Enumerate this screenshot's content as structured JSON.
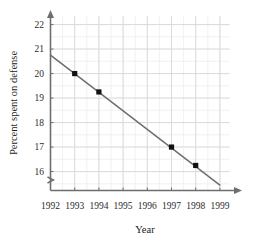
{
  "chart_data": {
    "type": "scatter",
    "title": "",
    "subtitle": "",
    "xlabel": "Year",
    "ylabel": "Percent spent on defense",
    "x": [
      1993,
      1994,
      1997,
      1998
    ],
    "values": [
      20.0,
      19.25,
      17.0,
      16.25
    ],
    "points": [
      {
        "x": 1993,
        "y": 20.0
      },
      {
        "x": 1994,
        "y": 19.25
      },
      {
        "x": 1997,
        "y": 17.0
      },
      {
        "x": 1998,
        "y": 16.25
      }
    ],
    "series": [
      {
        "name": "Percent spent on defense",
        "x": [
          1993,
          1994,
          1997,
          1998
        ],
        "values": [
          20.0,
          19.25,
          17.0,
          16.25
        ],
        "marker": "square",
        "marker_color": "#111111"
      },
      {
        "name": "trend line",
        "type": "line",
        "x": [
          1992,
          1999
        ],
        "values": [
          20.75,
          15.45
        ],
        "line_color": "#6e6e6e"
      }
    ],
    "xticks": [
      1992,
      1993,
      1994,
      1995,
      1996,
      1997,
      1998,
      1999
    ],
    "xtick_labels": [
      "1992",
      "1993",
      "1994",
      "1995",
      "1996",
      "1997",
      "1998",
      "1999"
    ],
    "yticks": [
      16,
      17,
      18,
      19,
      20,
      21,
      22
    ],
    "ytick_labels": [
      "16",
      "17",
      "18",
      "19",
      "20",
      "21",
      "22"
    ],
    "xlim": [
      1992,
      1999.4
    ],
    "ylim": [
      15.35,
      22.35
    ],
    "y_axis_break": true,
    "grid": true,
    "minor_grid": true,
    "minor_grid_step_x": 0.5,
    "minor_grid_step_y": 0.5,
    "legend": "none",
    "axis_arrows": true,
    "colors": {
      "major_grid": "#d9d9d9",
      "minor_grid": "#ededed",
      "axis": "#6e6e6e",
      "trend_line": "#6e6e6e",
      "marker": "#111111",
      "text": "#1a1a1a",
      "background": "#ffffff"
    }
  }
}
